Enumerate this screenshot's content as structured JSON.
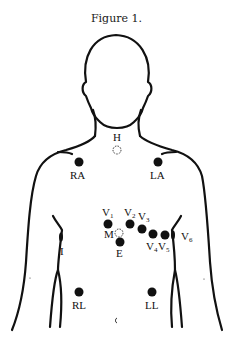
{
  "title": "Figure 1.",
  "colors": {
    "ink": "#111111",
    "background": "#ffffff"
  },
  "electrodes": [
    {
      "id": "H",
      "label": "H",
      "x": 117,
      "y": 150,
      "style": "dashed"
    },
    {
      "id": "RA",
      "label": "RA",
      "x": 79,
      "y": 162,
      "style": "filled"
    },
    {
      "id": "LA",
      "label": "LA",
      "x": 158,
      "y": 162,
      "style": "filled"
    },
    {
      "id": "V1",
      "label": "V",
      "sub": "1",
      "x": 108,
      "y": 224,
      "style": "filled"
    },
    {
      "id": "V2",
      "label": "V",
      "sub": "2",
      "x": 130,
      "y": 224,
      "style": "filled"
    },
    {
      "id": "V3",
      "label": "V",
      "sub": "3",
      "x": 142,
      "y": 229,
      "style": "filled"
    },
    {
      "id": "V4",
      "label": "V",
      "sub": "4",
      "x": 153,
      "y": 234,
      "style": "filled"
    },
    {
      "id": "V5",
      "label": "V",
      "sub": "5",
      "x": 165,
      "y": 235,
      "style": "filled"
    },
    {
      "id": "V6",
      "label": "V",
      "sub": "6",
      "x": 173,
      "y": 235,
      "style": "oval"
    },
    {
      "id": "M",
      "label": "M",
      "x": 119,
      "y": 233,
      "style": "dashed"
    },
    {
      "id": "E",
      "label": "E",
      "x": 120,
      "y": 242,
      "style": "filled"
    },
    {
      "id": "I",
      "label": "I",
      "x": 61,
      "y": 237,
      "style": "oval"
    },
    {
      "id": "RL",
      "label": "RL",
      "x": 79,
      "y": 292,
      "style": "filled"
    },
    {
      "id": "LL",
      "label": "LL",
      "x": 152,
      "y": 292,
      "style": "filled"
    }
  ],
  "labels": {
    "H": "H",
    "RA": "RA",
    "LA": "LA",
    "V": "V",
    "V1": "1",
    "V2": "2",
    "V3": "3",
    "V4": "4",
    "V5": "5",
    "V6": "6",
    "M": "M",
    "E": "E",
    "I": "I",
    "RL": "RL",
    "LL": "LL"
  }
}
